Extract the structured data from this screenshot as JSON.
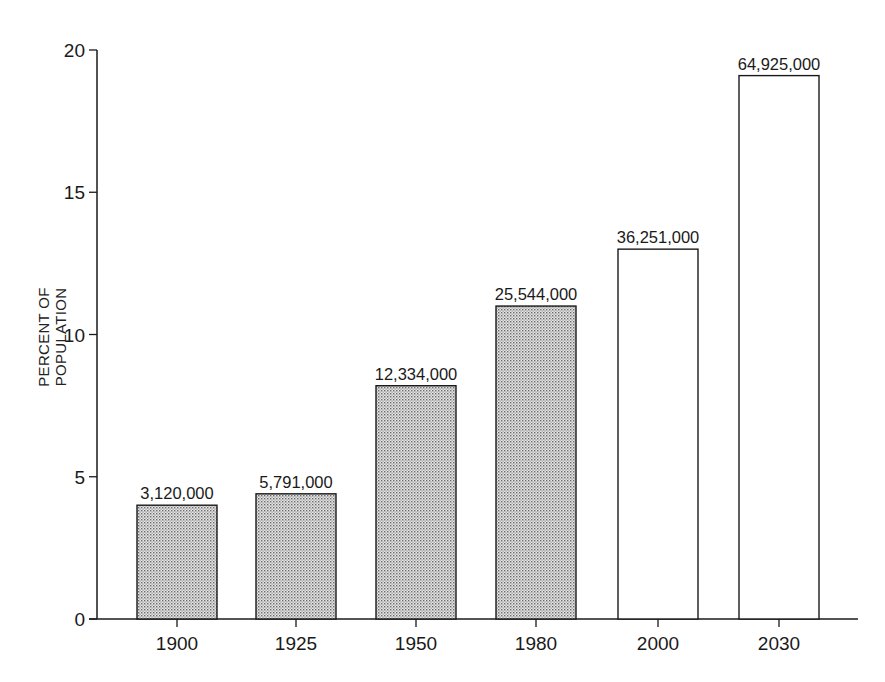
{
  "chart_data": {
    "type": "bar",
    "title": "",
    "xlabel": "",
    "ylabel": "PERCENT OF POPULATION",
    "ylim": [
      0,
      20
    ],
    "yticks": [
      0,
      5,
      10,
      15,
      20
    ],
    "grid": false,
    "legend": null,
    "categories": [
      "1900",
      "1925",
      "1950",
      "1980",
      "2000",
      "2030"
    ],
    "values": [
      4.0,
      4.4,
      8.2,
      11.0,
      13.0,
      19.1
    ],
    "data_labels": [
      "3,120,000",
      "5,791,000",
      "12,334,000",
      "25,544,000",
      "36,251,000",
      "64,925,000"
    ],
    "bar_styles": [
      "stippled",
      "stippled",
      "stippled",
      "stippled",
      "open",
      "open"
    ]
  },
  "colors": {
    "axis": "#1a1a1a",
    "stipple_fill": "#c8c8c8",
    "open_fill": "#ffffff"
  }
}
